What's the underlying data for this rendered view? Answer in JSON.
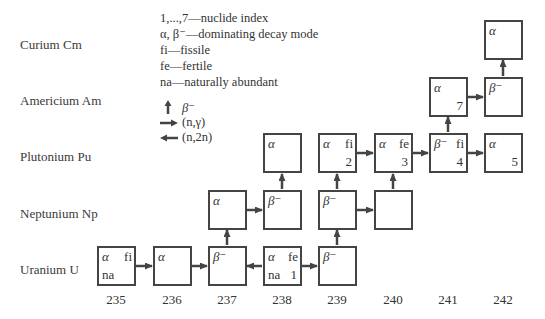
{
  "rows": [
    {
      "label": "Curium Cm",
      "key": "Cm"
    },
    {
      "label": "Americium Am",
      "key": "Am"
    },
    {
      "label": "Plutonium Pu",
      "key": "Pu"
    },
    {
      "label": "Neptunium Np",
      "key": "Np"
    },
    {
      "label": "Uranium U",
      "key": "U"
    }
  ],
  "legend": {
    "items": [
      "1,...,7—nuclide index",
      "α, β⁻—dominating decay mode",
      "fi—fissile",
      "fe—fertile",
      "na—naturally abundant"
    ],
    "arrows": [
      {
        "icon": "arrow-up-icon",
        "label": "β⁻"
      },
      {
        "icon": "arrow-right-icon",
        "label": "(n,γ)"
      },
      {
        "icon": "arrow-left-icon",
        "label": "(n,2n)"
      }
    ]
  },
  "mass_numbers": [
    "235",
    "236",
    "237",
    "238",
    "239",
    "240",
    "241",
    "242"
  ],
  "nuclides": {
    "U235": {
      "decay": "α",
      "tag": "fi",
      "na": "na",
      "index": ""
    },
    "U236": {
      "decay": "α",
      "tag": "",
      "na": "",
      "index": ""
    },
    "U237": {
      "decay": "β⁻",
      "tag": "",
      "na": "",
      "index": ""
    },
    "U238": {
      "decay": "α",
      "tag": "fe",
      "na": "na",
      "index": "1"
    },
    "U239": {
      "decay": "β⁻",
      "tag": "",
      "na": "",
      "index": ""
    },
    "Np237": {
      "decay": "α",
      "tag": "",
      "na": "",
      "index": ""
    },
    "Np238": {
      "decay": "β⁻",
      "tag": "",
      "na": "",
      "index": ""
    },
    "Np239": {
      "decay": "β⁻",
      "tag": "",
      "na": "",
      "index": ""
    },
    "Np240": {
      "decay": "",
      "tag": "",
      "na": "",
      "index": ""
    },
    "Pu238": {
      "decay": "α",
      "tag": "",
      "na": "",
      "index": ""
    },
    "Pu239": {
      "decay": "α",
      "tag": "fi",
      "na": "",
      "index": "2"
    },
    "Pu240": {
      "decay": "α",
      "tag": "fe",
      "na": "",
      "index": "3"
    },
    "Pu241": {
      "decay": "β⁻",
      "tag": "fi",
      "na": "",
      "index": "4"
    },
    "Pu242": {
      "decay": "α",
      "tag": "",
      "na": "",
      "index": "5"
    },
    "Am241": {
      "decay": "α",
      "tag": "",
      "na": "",
      "index": "7"
    },
    "Am242": {
      "decay": "β⁻",
      "tag": "",
      "na": "",
      "index": ""
    },
    "Cm242": {
      "decay": "α",
      "tag": "",
      "na": "",
      "index": ""
    }
  },
  "transitions": [
    {
      "from": "U235",
      "to": "U236",
      "type": "(n,γ)"
    },
    {
      "from": "U236",
      "to": "U237",
      "type": "(n,γ)"
    },
    {
      "from": "U238",
      "to": "U237",
      "type": "(n,2n)"
    },
    {
      "from": "U238",
      "to": "U239",
      "type": "(n,γ)"
    },
    {
      "from": "U237",
      "to": "Np237",
      "type": "β⁻"
    },
    {
      "from": "U239",
      "to": "Np239",
      "type": "β⁻"
    },
    {
      "from": "Np237",
      "to": "Np238",
      "type": "(n,γ)"
    },
    {
      "from": "Np239",
      "to": "Np240",
      "type": "(n,γ)"
    },
    {
      "from": "Np238",
      "to": "Pu238",
      "type": "β⁻"
    },
    {
      "from": "Np239",
      "to": "Pu239",
      "type": "β⁻"
    },
    {
      "from": "Np240",
      "to": "Pu240",
      "type": "β⁻"
    },
    {
      "from": "Pu239",
      "to": "Pu240",
      "type": "(n,γ)"
    },
    {
      "from": "Pu240",
      "to": "Pu241",
      "type": "(n,γ)"
    },
    {
      "from": "Pu241",
      "to": "Pu242",
      "type": "(n,γ)"
    },
    {
      "from": "Pu241",
      "to": "Am241",
      "type": "β⁻"
    },
    {
      "from": "Am241",
      "to": "Am242",
      "type": "(n,γ)"
    },
    {
      "from": "Am242",
      "to": "Cm242",
      "type": "β⁻"
    }
  ]
}
